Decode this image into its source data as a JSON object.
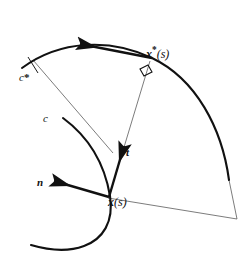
{
  "figure": {
    "background_color": "#ffffff",
    "stroke_color": "#111111",
    "thin_stroke_color": "#555555",
    "width": 252,
    "height": 261
  },
  "labels": {
    "derivative_numerator_d": "d",
    "derivative_numerator_x": "x",
    "derivative_numerator_star": "*",
    "derivative_denominator": "ds",
    "derivative_full": "dx*/ds",
    "x_star_of_s": "x*(s)",
    "x_star_base": "x",
    "x_star_star": "*",
    "x_star_arg": "(s)",
    "c_star": "c*",
    "c_star_base": "c",
    "c_star_star": "*",
    "c": "c",
    "tangent_vector": "t",
    "normal_vector": "n",
    "x_of_s": "x (s)",
    "x_base": "x",
    "x_arg": "(s)"
  },
  "elements": {
    "outer_curve_name": "c*",
    "inner_curve_name": "c",
    "tangent_name": "t",
    "normal_name": "n",
    "point_on_c": "x (s)",
    "point_on_c_star": "x*(s)",
    "right_angle_marker": "90-degree",
    "tick_on_outer_curve": "tick"
  }
}
